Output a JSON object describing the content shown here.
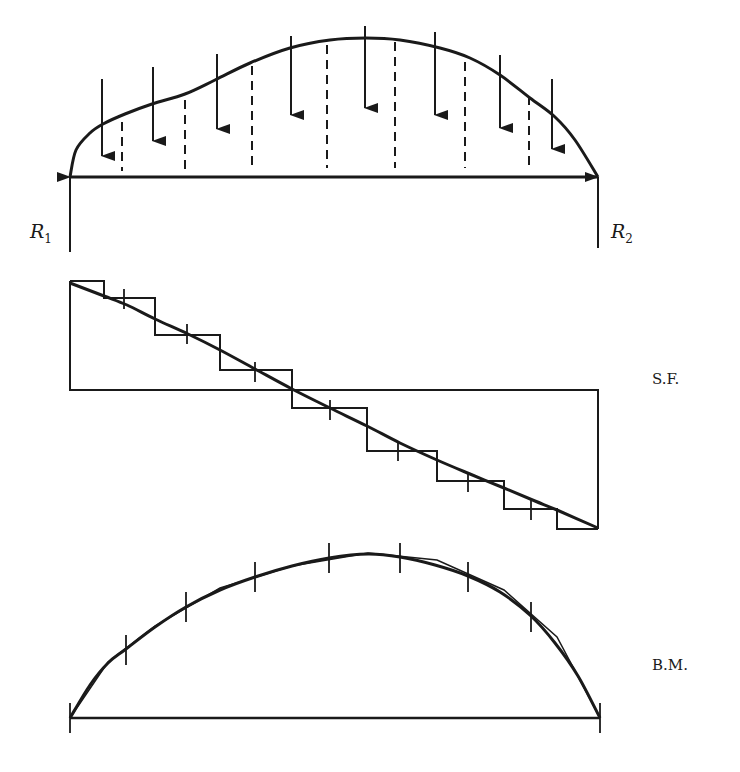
{
  "diagram": {
    "title": "",
    "colors": {
      "ink": "#1a1a1a",
      "background": "#ffffff"
    },
    "beam": {
      "x_start": 70,
      "x_end": 598,
      "y": 177,
      "load_curve": [
        [
          70,
          177
        ],
        [
          76,
          150
        ],
        [
          90,
          133
        ],
        [
          103,
          124
        ],
        [
          125,
          114
        ],
        [
          152,
          104
        ],
        [
          185,
          94
        ],
        [
          215,
          80
        ],
        [
          250,
          63
        ],
        [
          290,
          48
        ],
        [
          330,
          40
        ],
        [
          366,
          38
        ],
        [
          400,
          40
        ],
        [
          440,
          48
        ],
        [
          470,
          58
        ],
        [
          500,
          75
        ],
        [
          530,
          98
        ],
        [
          555,
          117
        ],
        [
          575,
          140
        ],
        [
          598,
          177
        ]
      ],
      "load_arrows": [
        {
          "x": 102,
          "y1": 79,
          "y2": 156
        },
        {
          "x": 153,
          "y1": 67,
          "y2": 141
        },
        {
          "x": 217,
          "y1": 54,
          "y2": 129
        },
        {
          "x": 291,
          "y1": 36,
          "y2": 115
        },
        {
          "x": 365,
          "y1": 26,
          "y2": 108
        },
        {
          "x": 435,
          "y1": 32,
          "y2": 115
        },
        {
          "x": 500,
          "y1": 55,
          "y2": 128
        },
        {
          "x": 552,
          "y1": 79,
          "y2": 149
        }
      ],
      "dashed_lines": [
        {
          "x": 122,
          "y1": 122,
          "y2": 171
        },
        {
          "x": 185,
          "y1": 100,
          "y2": 171
        },
        {
          "x": 252,
          "y1": 66,
          "y2": 168
        },
        {
          "x": 327,
          "y1": 45,
          "y2": 168
        },
        {
          "x": 395,
          "y1": 42,
          "y2": 168
        },
        {
          "x": 465,
          "y1": 62,
          "y2": 168
        },
        {
          "x": 529,
          "y1": 96,
          "y2": 166
        }
      ],
      "reactions": [
        {
          "name": "R1",
          "label": "R",
          "subscript": "1",
          "x": 70,
          "y_top": 177,
          "y_bottom": 252,
          "label_x": 30,
          "label_y": 238
        },
        {
          "name": "R2",
          "label": "R",
          "subscript": "2",
          "x": 598,
          "y_top": 177,
          "y_bottom": 248,
          "label_x": 611,
          "label_y": 238
        }
      ]
    },
    "shear_force": {
      "label": "S.F.",
      "label_x": 652,
      "label_y": 384,
      "baseline_y": 390,
      "x_start": 70,
      "x_end": 598,
      "stepped": [
        [
          70,
          281
        ],
        [
          104,
          281
        ],
        [
          104,
          298
        ],
        [
          155,
          298
        ],
        [
          155,
          335
        ],
        [
          220,
          335
        ],
        [
          220,
          370
        ],
        [
          292,
          370
        ],
        [
          292,
          408
        ],
        [
          367,
          408
        ],
        [
          367,
          451
        ],
        [
          437,
          451
        ],
        [
          437,
          481
        ],
        [
          504,
          481
        ],
        [
          504,
          509
        ],
        [
          557,
          509
        ],
        [
          557,
          529
        ],
        [
          598,
          529
        ]
      ],
      "curve": [
        [
          70,
          283
        ],
        [
          104,
          296
        ],
        [
          127,
          305
        ],
        [
          155,
          319
        ],
        [
          188,
          334
        ],
        [
          220,
          350
        ],
        [
          255,
          369
        ],
        [
          292,
          389
        ],
        [
          330,
          408
        ],
        [
          367,
          426
        ],
        [
          400,
          443
        ],
        [
          437,
          460
        ],
        [
          470,
          474
        ],
        [
          504,
          488
        ],
        [
          535,
          501
        ],
        [
          557,
          510
        ],
        [
          598,
          528
        ]
      ],
      "ticks": [
        {
          "x": 124,
          "y": 299
        },
        {
          "x": 187,
          "y": 334
        },
        {
          "x": 255,
          "y": 372
        },
        {
          "x": 330,
          "y": 410
        },
        {
          "x": 398,
          "y": 451
        },
        {
          "x": 468,
          "y": 482
        },
        {
          "x": 531,
          "y": 510
        }
      ]
    },
    "bending_moment": {
      "label": "B.M.",
      "label_x": 652,
      "label_y": 670,
      "baseline_y": 718,
      "x_start": 70,
      "x_end": 600,
      "curve": [
        [
          70,
          718
        ],
        [
          90,
          685
        ],
        [
          108,
          663
        ],
        [
          126,
          649
        ],
        [
          155,
          627
        ],
        [
          186,
          607
        ],
        [
          220,
          590
        ],
        [
          255,
          577
        ],
        [
          292,
          566
        ],
        [
          329,
          558
        ],
        [
          368,
          554
        ],
        [
          400,
          557
        ],
        [
          435,
          565
        ],
        [
          468,
          576
        ],
        [
          500,
          592
        ],
        [
          531,
          616
        ],
        [
          555,
          643
        ],
        [
          578,
          676
        ],
        [
          600,
          718
        ]
      ],
      "polygon": [
        [
          70,
          718
        ],
        [
          108,
          662
        ],
        [
          155,
          626
        ],
        [
          220,
          588
        ],
        [
          292,
          566
        ],
        [
          368,
          553
        ],
        [
          437,
          560
        ],
        [
          504,
          590
        ],
        [
          557,
          637
        ],
        [
          600,
          718
        ]
      ],
      "ticks": [
        {
          "x": 70,
          "y": 718
        },
        {
          "x": 126,
          "y": 650
        },
        {
          "x": 186,
          "y": 607
        },
        {
          "x": 255,
          "y": 577
        },
        {
          "x": 329,
          "y": 558
        },
        {
          "x": 400,
          "y": 558
        },
        {
          "x": 468,
          "y": 577
        },
        {
          "x": 531,
          "y": 617
        },
        {
          "x": 600,
          "y": 718
        }
      ]
    }
  }
}
